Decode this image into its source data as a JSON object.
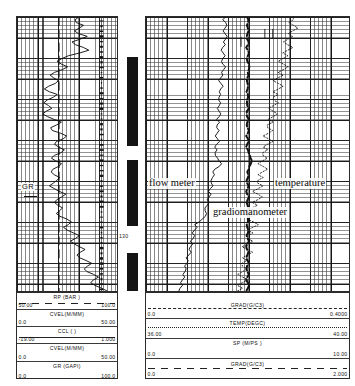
{
  "document": {
    "kind": "well-production-log",
    "depth_marker": "130"
  },
  "annotations": [
    {
      "id": "gr",
      "label": "GR"
    },
    {
      "id": "flow-meter",
      "label": "flow meter"
    },
    {
      "id": "temperature",
      "label": "temperature"
    },
    {
      "id": "gradiomanometer",
      "label": "gradiomanometer"
    }
  ],
  "left_track": {
    "name": "GR / CCL / CVEL track",
    "scales": [
      {
        "mnemonic": "RP   (BAR )",
        "min": "50.00",
        "max": "100.0",
        "style": "longdash"
      },
      {
        "mnemonic": "CVEL(M/MM)",
        "min": "0.0",
        "max": "50.00",
        "style": "none"
      },
      {
        "mnemonic": "CCL (     )",
        "min": "-19.00",
        "max": "1.000",
        "style": "solid"
      },
      {
        "mnemonic": "CVEL(M/MM)",
        "min": "0.0",
        "max": "50.00",
        "style": "none"
      },
      {
        "mnemonic": "GR   (GAPI)",
        "min": "0.0",
        "max": "100.0",
        "style": "none"
      }
    ]
  },
  "right_track": {
    "name": "Gradiomanometer / Temperature / Spinner track",
    "scales": [
      {
        "mnemonic": "GRAD(G/C3)",
        "min": "0.0",
        "max": "0.4000",
        "style": "dashed"
      },
      {
        "mnemonic": "TEMP(DEGC)",
        "min": "36.00",
        "max": "40.00",
        "style": "dotted"
      },
      {
        "mnemonic": "SP (M/PS )",
        "min": "0.0",
        "max": "10.00",
        "style": "solid"
      },
      {
        "mnemonic": "GRAD(G/C3)",
        "min": "0.0",
        "max": "2.000",
        "style": "longdash"
      }
    ]
  },
  "chart_data": {
    "type": "line",
    "orientation": "vertical-depth",
    "ylabel": "Depth (m)",
    "ydepth_marker": 130,
    "grid": true,
    "legend": "scale-blocks-below",
    "curves": [
      {
        "name": "GR",
        "track": "left",
        "units": "GAPI",
        "xlim": [
          0.0,
          100.0
        ],
        "style": "solid",
        "values": [
          62,
          58,
          60,
          66,
          63,
          57,
          61,
          70,
          64,
          55,
          58,
          66,
          72,
          63,
          52,
          45,
          40,
          44,
          50,
          46,
          38,
          33,
          36,
          42,
          38,
          31,
          28,
          33,
          40,
          36,
          30,
          27,
          31,
          35,
          29,
          25,
          30,
          37,
          44,
          39,
          33,
          36,
          43,
          50,
          46,
          40,
          37,
          41,
          48,
          44,
          38,
          35,
          39,
          45,
          41,
          36,
          34,
          38,
          43,
          40,
          36,
          33,
          37,
          42,
          48,
          44,
          39,
          37,
          41,
          46,
          42,
          39,
          43,
          49,
          55,
          51,
          47,
          50,
          56,
          62,
          58,
          54,
          57,
          63,
          68,
          64,
          60,
          63,
          69,
          75,
          71,
          67,
          70,
          76,
          81,
          77,
          74,
          78,
          84,
          90
        ]
      },
      {
        "name": "CCL",
        "track": "left",
        "units": "",
        "xlim": [
          -19.0,
          1.0
        ],
        "style": "dashed-vertical",
        "nominal": 0.42
      },
      {
        "name": "RP",
        "track": "left",
        "units": "BAR",
        "xlim": [
          50.0,
          100.0
        ],
        "style": "solid-vertical",
        "nominal": 0.26
      },
      {
        "name": "flow meter",
        "track": "right",
        "units": "M/PS",
        "xlim": [
          0.0,
          10.0
        ],
        "style": "solid",
        "values": [
          3.9,
          3.8,
          3.9,
          4.0,
          3.9,
          3.8,
          3.9,
          4.0,
          3.9,
          3.8,
          3.9,
          3.8,
          3.7,
          3.8,
          3.9,
          3.8,
          3.7,
          3.8,
          3.9,
          3.8,
          3.7,
          3.8,
          3.7,
          3.6,
          3.7,
          3.8,
          3.7,
          3.6,
          3.7,
          3.6,
          3.6,
          3.7,
          3.6,
          3.5,
          3.6,
          3.7,
          3.6,
          3.5,
          3.6,
          3.5,
          3.5,
          3.6,
          3.5,
          3.4,
          3.5,
          3.6,
          3.5,
          3.4,
          3.5,
          3.4,
          3.4,
          3.5,
          3.6,
          3.7,
          3.6,
          3.4,
          3.3,
          3.4,
          3.3,
          3.2,
          3.2,
          3.3,
          3.2,
          3.1,
          3.2,
          3.1,
          3.0,
          3.1,
          3.0,
          2.9,
          2.9,
          3.0,
          2.9,
          2.8,
          2.6,
          2.4,
          2.5,
          2.4,
          2.3,
          2.4,
          2.3,
          2.2,
          2.3,
          2.2,
          2.1,
          2.2,
          2.1,
          2.0,
          2.1,
          2.0,
          1.9,
          2.0,
          1.9,
          1.8,
          1.9,
          1.8,
          1.7,
          1.8,
          1.7,
          1.6
        ]
      },
      {
        "name": "gradiomanometer",
        "track": "right",
        "units": "G/C3",
        "xlim": [
          0.0,
          2.0
        ],
        "style": "heavy-dashed",
        "values": [
          1.0,
          1.01,
          1.0,
          0.99,
          1.0,
          1.01,
          1.0,
          0.99,
          1.0,
          1.01,
          1.0,
          0.99,
          1.0,
          1.01,
          1.0,
          0.99,
          1.0,
          1.01,
          1.02,
          1.01,
          1.0,
          1.01,
          1.0,
          0.99,
          1.0,
          1.01,
          1.0,
          0.99,
          1.0,
          1.01,
          1.0,
          0.99,
          1.0,
          1.01,
          1.0,
          0.99,
          1.0,
          1.01,
          1.0,
          0.99,
          1.0,
          1.01,
          1.0,
          0.99,
          1.0,
          1.01,
          1.0,
          0.99,
          1.0,
          1.01,
          1.02,
          1.03,
          1.04,
          1.03,
          1.02,
          1.01,
          1.0,
          1.01,
          1.0,
          0.99,
          1.0,
          1.01,
          1.0,
          0.99,
          1.0,
          1.01,
          1.0,
          0.99,
          1.0,
          1.01,
          1.0,
          0.99,
          1.0,
          1.01,
          1.0,
          0.99,
          1.0,
          1.01,
          1.0,
          0.99,
          1.0,
          1.01,
          1.0,
          0.99,
          1.0,
          1.01,
          1.0,
          0.99,
          1.0,
          1.01,
          1.0,
          0.99,
          1.0,
          1.01,
          1.0,
          0.99,
          1.0,
          1.01,
          1.0,
          0.99
        ]
      },
      {
        "name": "temperature",
        "track": "right",
        "units": "DEGC",
        "xlim": [
          36.0,
          40.0
        ],
        "style": "dotted",
        "values": [
          38.9,
          38.9,
          38.8,
          38.9,
          39.0,
          38.9,
          38.8,
          38.9,
          38.8,
          38.7,
          38.8,
          38.9,
          38.8,
          38.7,
          38.8,
          38.7,
          38.6,
          38.7,
          38.8,
          38.7,
          38.6,
          38.7,
          38.6,
          38.5,
          38.6,
          38.7,
          38.6,
          38.5,
          38.6,
          38.5,
          38.5,
          38.6,
          38.5,
          38.4,
          38.5,
          38.6,
          38.5,
          38.4,
          38.5,
          38.4,
          38.4,
          38.5,
          38.4,
          38.3,
          38.4,
          38.5,
          38.4,
          38.3,
          38.4,
          38.3,
          38.3,
          38.4,
          38.3,
          38.2,
          38.3,
          38.4,
          38.3,
          38.2,
          38.3,
          38.2,
          38.2,
          38.3,
          38.2,
          38.1,
          38.2,
          38.3,
          38.2,
          38.1,
          38.2,
          38.1,
          38.1,
          38.2,
          38.1,
          38.0,
          38.1,
          38.2,
          38.1,
          38.0,
          38.1,
          38.0,
          38.0,
          38.1,
          38.0,
          37.9,
          38.0,
          38.1,
          38.0,
          37.9,
          38.0,
          37.9,
          37.9,
          38.0,
          37.9,
          37.8,
          37.9,
          38.0,
          37.9,
          37.8,
          37.9,
          37.8
        ]
      }
    ],
    "casing_intervals": [
      {
        "top": 57,
        "bottom": 146
      },
      {
        "top": 160,
        "bottom": 226
      },
      {
        "top": 253,
        "bottom": 291
      }
    ]
  }
}
